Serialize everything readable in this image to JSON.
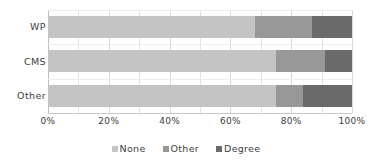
{
  "chart_data": {
    "type": "bar",
    "orientation": "horizontal",
    "stacked": true,
    "normalized": true,
    "title": "",
    "xlabel": "",
    "ylabel": "",
    "categories": [
      "WP",
      "CMS",
      "Other"
    ],
    "series": [
      {
        "name": "None",
        "color": "#c4c4c4",
        "values": [
          68,
          75,
          75
        ]
      },
      {
        "name": "Other",
        "color": "#989898",
        "values": [
          19,
          16,
          9
        ]
      },
      {
        "name": "Degree",
        "color": "#6a6a6a",
        "values": [
          13,
          9,
          16
        ]
      }
    ],
    "xlim": [
      0,
      100
    ],
    "xticks": [
      0,
      20,
      40,
      60,
      80,
      100
    ],
    "xtick_labels": [
      "0%",
      "20%",
      "40%",
      "60%",
      "80%",
      "100%"
    ],
    "gridlines": {
      "vertical": true,
      "interval": 10,
      "horizontal": true
    },
    "legend": {
      "position": "bottom",
      "entries": [
        "None",
        "Other",
        "Degree"
      ]
    }
  },
  "colors": {
    "background": "#ffffff",
    "text": "#404040",
    "grid": "#e2e2e2",
    "axis": "#c9c9c9",
    "none": "#c4c4c4",
    "other": "#989898",
    "degree": "#6a6a6a"
  }
}
